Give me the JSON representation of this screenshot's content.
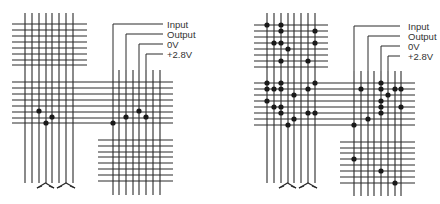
{
  "colors": {
    "line": "#2a2a2a",
    "dot": "#1a1a1a",
    "text": "#333333",
    "background": "#ffffff"
  },
  "diagrams": [
    {
      "id": "left",
      "labels": [
        {
          "text": "Input",
          "x": 167,
          "y": 28,
          "lead": {
            "x": 113,
            "y": 24,
            "x2": 163
          }
        },
        {
          "text": "Output",
          "x": 167,
          "y": 38,
          "lead": {
            "x": 126,
            "y": 34,
            "x2": 163
          }
        },
        {
          "text": "0V",
          "x": 167,
          "y": 48,
          "lead": {
            "x": 139,
            "y": 44,
            "x2": 163
          }
        },
        {
          "text": "+2.8V",
          "x": 167,
          "y": 58,
          "lead": {
            "x": 146,
            "y": 54,
            "x2": 163
          }
        }
      ],
      "left_verticals": {
        "xs": [
          25,
          32,
          39,
          46,
          52,
          59,
          66,
          73
        ],
        "y1": 13,
        "y2": 183
      },
      "top_horizontals": {
        "ys": [
          24,
          30,
          36,
          42,
          48,
          54,
          60,
          65
        ],
        "x1": 12,
        "x2": 87
      },
      "mid_horizontals": {
        "ys": [
          82,
          88,
          94,
          100,
          106,
          112,
          118,
          123
        ],
        "x1": 12,
        "x2": 173
      },
      "right_verticals": {
        "xs": [
          113,
          119,
          126,
          133,
          139,
          146,
          153,
          160
        ],
        "y1": 70,
        "y2": 195
      },
      "bottom_horizontals": {
        "ys": [
          140,
          146,
          152,
          157,
          163,
          169,
          175,
          181
        ],
        "x1": 98,
        "x2": 173
      },
      "symbols": [
        {
          "x": 39,
          "x2": 52,
          "y": 183
        },
        {
          "x": 59,
          "x2": 73,
          "y": 183
        }
      ],
      "dots": [
        [
          39,
          111
        ],
        [
          52,
          117
        ],
        [
          46,
          123
        ],
        [
          113,
          123
        ],
        [
          126,
          117
        ],
        [
          139,
          111
        ],
        [
          146,
          117
        ]
      ]
    },
    {
      "id": "right",
      "labels": [
        {
          "text": "Input",
          "x": 408,
          "y": 30,
          "lead": {
            "x": 354,
            "y": 26,
            "x2": 400
          }
        },
        {
          "text": "Output",
          "x": 408,
          "y": 40,
          "lead": {
            "x": 368,
            "y": 36,
            "x2": 400
          }
        },
        {
          "text": "0V",
          "x": 408,
          "y": 50,
          "lead": {
            "x": 381,
            "y": 46,
            "x2": 400
          }
        },
        {
          "text": "+2.8V",
          "x": 408,
          "y": 60,
          "lead": {
            "x": 388,
            "y": 56,
            "x2": 400
          }
        }
      ],
      "left_verticals": {
        "xs": [
          267,
          274,
          281,
          288,
          294,
          301,
          308,
          315
        ],
        "y1": 13,
        "y2": 183
      },
      "top_horizontals": {
        "ys": [
          25,
          31,
          37,
          43,
          49,
          55,
          61,
          67
        ],
        "x1": 254,
        "x2": 328
      },
      "mid_horizontals": {
        "ys": [
          83,
          89,
          95,
          101,
          107,
          113,
          119,
          125
        ],
        "x1": 254,
        "x2": 415
      },
      "right_verticals": {
        "xs": [
          354,
          361,
          368,
          374,
          381,
          388,
          395,
          401
        ],
        "y1": 71,
        "y2": 196
      },
      "bottom_horizontals": {
        "ys": [
          142,
          148,
          153,
          159,
          165,
          171,
          177,
          183
        ],
        "x1": 340,
        "x2": 415
      },
      "symbols": [
        {
          "x": 281,
          "x2": 294,
          "y": 183
        },
        {
          "x": 301,
          "x2": 315,
          "y": 183
        }
      ],
      "dots": [
        [
          267,
          25
        ],
        [
          281,
          25
        ],
        [
          281,
          31
        ],
        [
          315,
          31
        ],
        [
          274,
          43
        ],
        [
          281,
          43
        ],
        [
          315,
          43
        ],
        [
          288,
          49
        ],
        [
          281,
          61
        ],
        [
          308,
          61
        ],
        [
          267,
          83
        ],
        [
          281,
          83
        ],
        [
          315,
          83
        ],
        [
          267,
          89
        ],
        [
          274,
          89
        ],
        [
          281,
          89
        ],
        [
          308,
          89
        ],
        [
          294,
          95
        ],
        [
          267,
          101
        ],
        [
          274,
          107
        ],
        [
          281,
          107
        ],
        [
          281,
          113
        ],
        [
          308,
          113
        ],
        [
          315,
          113
        ],
        [
          294,
          119
        ],
        [
          288,
          125
        ],
        [
          381,
          83
        ],
        [
          361,
          89
        ],
        [
          381,
          89
        ],
        [
          395,
          89
        ],
        [
          401,
          89
        ],
        [
          388,
          95
        ],
        [
          381,
          101
        ],
        [
          381,
          107
        ],
        [
          401,
          107
        ],
        [
          381,
          113
        ],
        [
          368,
          119
        ],
        [
          354,
          125
        ],
        [
          354,
          159
        ],
        [
          381,
          171
        ],
        [
          395,
          183
        ]
      ]
    }
  ]
}
